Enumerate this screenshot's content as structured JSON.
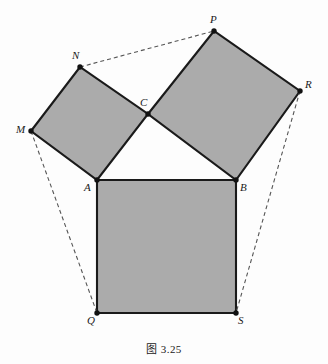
{
  "figure": {
    "caption": "图 3.25",
    "background_color": "#fdfdfd",
    "fill_color": "#ababab",
    "stroke_color": "#1a1a1a",
    "dash_color": "#555555"
  },
  "labels": {
    "P": "P",
    "N": "N",
    "R": "R",
    "M": "M",
    "C": "C",
    "A": "A",
    "B": "B",
    "Q": "Q",
    "S": "S"
  },
  "geometry": {
    "points": {
      "P": {
        "x": 214,
        "y": 31
      },
      "N": {
        "x": 80,
        "y": 67
      },
      "R": {
        "x": 300,
        "y": 91
      },
      "M": {
        "x": 31,
        "y": 131
      },
      "C": {
        "x": 148,
        "y": 114
      },
      "A": {
        "x": 97,
        "y": 180
      },
      "B": {
        "x": 236,
        "y": 180
      },
      "Q": {
        "x": 97,
        "y": 313
      },
      "S": {
        "x": 236,
        "y": 313
      }
    },
    "squares": [
      {
        "name": "square-MNCA",
        "vertices": [
          "M",
          "N",
          "C",
          "A"
        ]
      },
      {
        "name": "square-CPRB",
        "vertices": [
          "C",
          "P",
          "R",
          "B"
        ]
      },
      {
        "name": "square-ABSQ",
        "vertices": [
          "A",
          "B",
          "S",
          "Q"
        ]
      }
    ],
    "dashed_segments": [
      {
        "name": "dashed-N-P",
        "from": "N",
        "to": "P"
      },
      {
        "name": "dashed-M-Q",
        "from": "M",
        "to": "Q"
      },
      {
        "name": "dashed-R-S",
        "from": "R",
        "to": "S"
      }
    ],
    "label_offsets": {
      "P": {
        "x": 210,
        "y": 14
      },
      "N": {
        "x": 72,
        "y": 50
      },
      "R": {
        "x": 305,
        "y": 79
      },
      "M": {
        "x": 16,
        "y": 124
      },
      "C": {
        "x": 140,
        "y": 97
      },
      "A": {
        "x": 84,
        "y": 182
      },
      "B": {
        "x": 240,
        "y": 182
      },
      "Q": {
        "x": 87,
        "y": 315
      },
      "S": {
        "x": 238,
        "y": 315
      }
    }
  }
}
